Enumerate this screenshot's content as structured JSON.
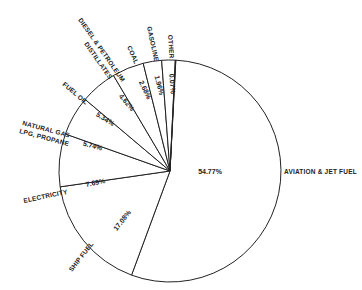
{
  "chart_data": {
    "type": "pie",
    "title": "",
    "center": [
      170,
      171
    ],
    "radius": 111,
    "start_angle_deg": -87,
    "direction": "clockwise",
    "slices": [
      {
        "label": "AVIATION & JET FUEL",
        "value": 54.77,
        "pct_text": "54.77%"
      },
      {
        "label": "SHIP FUEL",
        "value": 17.08,
        "pct_text": "17.08%"
      },
      {
        "label": "ELECTRICITY",
        "value": 7.69,
        "pct_text": "7.69%"
      },
      {
        "label": "NATURAL GAS LPG, PROPANE",
        "value": 5.74,
        "pct_text": "5.74%"
      },
      {
        "label": "FUEL OIL",
        "value": 5.34,
        "pct_text": "5.34%"
      },
      {
        "label": "DIESEL & PETROLEUM DISTILLATES",
        "value": 4.62,
        "pct_text": "4.62%"
      },
      {
        "label": "COAL",
        "value": 2.68,
        "pct_text": "2.68%"
      },
      {
        "label": "GASOLINE",
        "value": 1.96,
        "pct_text": "1.96%"
      },
      {
        "label": "OTHER",
        "value": 0.07,
        "pct_text": "0.07%"
      }
    ],
    "colors": {
      "stroke": "#222222",
      "fill": "#ffffff"
    }
  },
  "labels": {
    "aviation": "AVIATION & JET FUEL",
    "ship": "SHIP FUEL",
    "electricity": "ELECTRICITY",
    "natgas_line1": "NATURAL GAS",
    "natgas_line2": "LPG, PROPANE",
    "fueloil": "FUEL OIL",
    "diesel_line1": "DIESEL & PETROLEUM",
    "diesel_line2": "DISTILLATES",
    "coal": "COAL",
    "gasoline": "GASOLINE",
    "other": "OTHER"
  },
  "percents": {
    "aviation": "54.77%",
    "ship": "17.08%",
    "electricity": "7.69%",
    "natgas": "5.74%",
    "fueloil": "5.34%",
    "diesel": "4.62%",
    "coal": "2.68%",
    "gasoline": "1.96%",
    "other": "0.07%"
  }
}
